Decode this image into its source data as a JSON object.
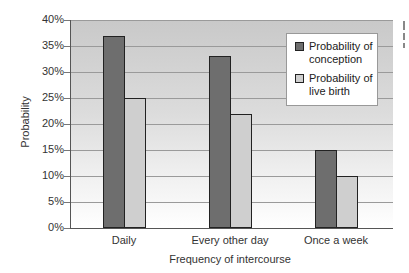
{
  "chart_data": {
    "type": "bar",
    "title": "",
    "xlabel": "Frequency of intercourse",
    "ylabel": "Probability",
    "categories": [
      "Daily",
      "Every other day",
      "Once a week"
    ],
    "series": [
      {
        "name": "Probability of conception",
        "color": "#6e6e6e",
        "values": [
          37,
          33,
          15
        ]
      },
      {
        "name": "Probability of live birth",
        "color": "#cfcfcf",
        "values": [
          25,
          22,
          10
        ]
      }
    ],
    "ylim": [
      0,
      40
    ],
    "yticks": [
      "0%",
      "5%",
      "10%",
      "15%",
      "20%",
      "25%",
      "30%",
      "35%",
      "40%"
    ],
    "grid": true,
    "legend_position": "upper right"
  },
  "legend": {
    "item1": "Probability of conception",
    "item2": "Probability of live birth"
  }
}
